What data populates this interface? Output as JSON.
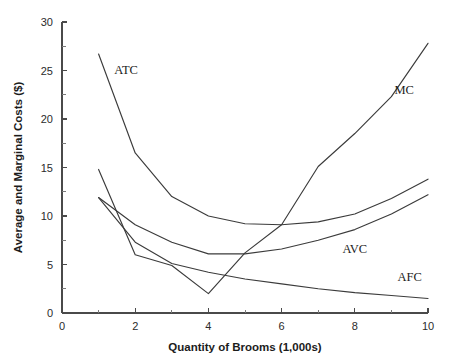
{
  "chart_data": {
    "type": "line",
    "title": "",
    "xlabel": "Quantity of Brooms (1,000s)",
    "ylabel": "Average and Marginal Costs ($)",
    "xlim": [
      0,
      10
    ],
    "ylim": [
      0,
      30
    ],
    "grid": false,
    "legend_position": "inline-annotations",
    "x_major_ticks": [
      0,
      2,
      4,
      6,
      8,
      10
    ],
    "x_minor_ticks": [
      1,
      3,
      5,
      7,
      9
    ],
    "x_tick_labels": [
      "0",
      "2",
      "4",
      "6",
      "8",
      "10"
    ],
    "y_major_ticks": [
      0,
      5,
      10,
      15,
      20,
      25,
      30
    ],
    "y_minor_ticks": [
      2.5,
      7.5,
      12.5,
      17.5,
      22.5,
      27.5
    ],
    "y_tick_labels": [
      "0",
      "5",
      "10",
      "15",
      "20",
      "25",
      "30"
    ],
    "x": [
      1,
      2,
      3,
      4,
      5,
      6,
      7,
      8,
      9,
      10
    ],
    "series": [
      {
        "name": "ATC",
        "label": "ATC",
        "label_x": 1.75,
        "label_y": 24.6,
        "values": [
          26.7,
          16.5,
          12.0,
          10.0,
          9.2,
          9.1,
          9.4,
          10.2,
          11.8,
          13.8
        ]
      },
      {
        "name": "MC",
        "label": "MC",
        "label_x": 9.35,
        "label_y": 22.6,
        "values": [
          14.8,
          6.0,
          4.9,
          2.0,
          6.2,
          9.1,
          15.1,
          18.5,
          22.3,
          27.8
        ]
      },
      {
        "name": "AVC",
        "label": "AVC",
        "label_x": 8.0,
        "label_y": 6.2,
        "values": [
          11.9,
          9.1,
          7.3,
          6.1,
          6.1,
          6.6,
          7.5,
          8.6,
          10.2,
          12.2
        ]
      },
      {
        "name": "AFC",
        "label": "AFC",
        "label_x": 9.5,
        "label_y": 3.3,
        "values": [
          11.9,
          7.3,
          5.1,
          4.2,
          3.5,
          3.0,
          2.5,
          2.1,
          1.8,
          1.5
        ]
      }
    ],
    "colors": {
      "curve": "#3b3b3b",
      "axis": "#4a4a4a",
      "text": "#1c1c1c",
      "background": "#ffffff"
    }
  }
}
